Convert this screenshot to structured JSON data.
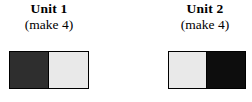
{
  "figure": {
    "background_color": "#ffffff",
    "width": 252,
    "height": 102
  },
  "units": [
    {
      "title": "Unit 1",
      "subtitle": "(make 4)",
      "patch": {
        "orientation": "horizontal",
        "halves": [
          {
            "position": "left",
            "shade": "dark",
            "color": "#2e2e2e"
          },
          {
            "position": "right",
            "shade": "light",
            "color": "#e9e9e9"
          }
        ],
        "border_color": "#000000"
      }
    },
    {
      "title": "Unit 2",
      "subtitle": "(make 4)",
      "patch": {
        "orientation": "horizontal",
        "halves": [
          {
            "position": "left",
            "shade": "light",
            "color": "#e9e9e9"
          },
          {
            "position": "right",
            "shade": "black",
            "color": "#0d0d0d"
          }
        ],
        "border_color": "#000000"
      }
    }
  ]
}
